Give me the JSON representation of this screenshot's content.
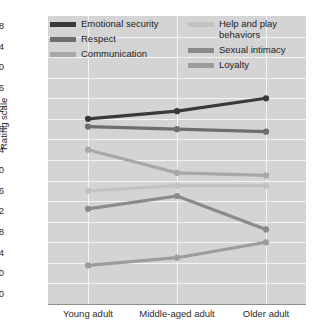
{
  "chart_data": {
    "type": "line",
    "title": "",
    "xlabel": "",
    "ylabel": "Rating scale",
    "categories": [
      "Young adult",
      "Middle-aged adult",
      "Older adult"
    ],
    "ylim": [
      3.0,
      7.8
    ],
    "y_axis_break": true,
    "yticks": [
      "0.0",
      "3.0",
      "3.4",
      "3.8",
      "4.2",
      "4.6",
      "5.0",
      "5.4",
      "5.8",
      "6.2",
      "6.6",
      "7.0",
      "7.4",
      "7.8"
    ],
    "grid": true,
    "legend_position": "top-inside",
    "series": [
      {
        "name": "Emotional security",
        "values": [
          6.0,
          6.15,
          6.4
        ],
        "color": "#3a3a3a"
      },
      {
        "name": "Respect",
        "values": [
          5.85,
          5.8,
          5.75
        ],
        "color": "#6e6e6e"
      },
      {
        "name": "Communication",
        "values": [
          5.4,
          4.95,
          4.9
        ],
        "color": "#a8a8a8"
      },
      {
        "name": "Help and play\nbehaviors",
        "values": [
          4.6,
          4.7,
          4.7
        ],
        "color": "#c2c2c2"
      },
      {
        "name": "Sexual intimacy",
        "values": [
          4.25,
          4.5,
          3.85
        ],
        "color": "#8a8a8a"
      },
      {
        "name": "Loyalty",
        "values": [
          3.15,
          3.3,
          3.6
        ],
        "color": "#9c9c9c"
      }
    ]
  },
  "axis": {
    "y_label": "Rating scale",
    "y_ticks": [
      "7.8",
      "7.4",
      "7.0",
      "6.6",
      "6.2",
      "5.8",
      "5.4",
      "5.0",
      "4.6",
      "4.2",
      "3.8",
      "3.4",
      "3.0",
      "0.0"
    ],
    "x_ticks": [
      "Young adult",
      "Middle-aged adult",
      "Older adult"
    ]
  },
  "legend": {
    "items": [
      {
        "label": "Emotional security",
        "color": "#3a3a3a"
      },
      {
        "label": "Respect",
        "color": "#6e6e6e"
      },
      {
        "label": "Communication",
        "color": "#a8a8a8"
      },
      {
        "label": "Help and play\nbehaviors",
        "color": "#c2c2c2"
      },
      {
        "label": "Sexual intimacy",
        "color": "#8a8a8a"
      },
      {
        "label": "Loyalty",
        "color": "#9c9c9c"
      }
    ]
  },
  "colors": {
    "plot_background": "#d4d4d4",
    "gridline": "#f4f4f4",
    "axis": "#8d8d8d",
    "text": "#2b2b2b"
  }
}
